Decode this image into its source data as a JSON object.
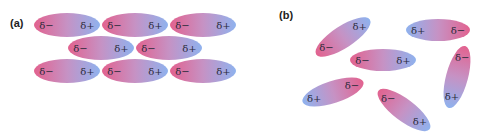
{
  "colors": {
    "negative": "#e2628f",
    "positive": "#8fb2ee",
    "background": "#ffffff",
    "text": "#2a2a3a"
  },
  "panel_a": {
    "label": "(a)",
    "description": "ordered dipoles aligned head-to-tail",
    "molecules": [
      {
        "cx": 67,
        "cy": 25,
        "rx": 33,
        "ry": 12,
        "angle": 0,
        "neg": "δ−",
        "pos": "δ+"
      },
      {
        "cx": 135,
        "cy": 25,
        "rx": 33,
        "ry": 12,
        "angle": 0,
        "neg": "δ−",
        "pos": "δ+"
      },
      {
        "cx": 203,
        "cy": 25,
        "rx": 33,
        "ry": 12,
        "angle": 0,
        "neg": "δ−",
        "pos": "δ+"
      },
      {
        "cx": 101,
        "cy": 48,
        "rx": 33,
        "ry": 12,
        "angle": 0,
        "neg": "δ−",
        "pos": "δ+"
      },
      {
        "cx": 169,
        "cy": 48,
        "rx": 33,
        "ry": 12,
        "angle": 0,
        "neg": "δ−",
        "pos": "δ+"
      },
      {
        "cx": 67,
        "cy": 71,
        "rx": 33,
        "ry": 12,
        "angle": 0,
        "neg": "δ−",
        "pos": "δ+"
      },
      {
        "cx": 135,
        "cy": 71,
        "rx": 33,
        "ry": 12,
        "angle": 0,
        "neg": "δ−",
        "pos": "δ+"
      },
      {
        "cx": 203,
        "cy": 71,
        "rx": 33,
        "ry": 12,
        "angle": 0,
        "neg": "δ−",
        "pos": "δ+"
      }
    ]
  },
  "panel_b": {
    "label": "(b)",
    "description": "randomly oriented dipoles",
    "molecules": [
      {
        "cx": 343,
        "cy": 37,
        "rx": 32,
        "ry": 11,
        "angle": -33,
        "neg": "δ−",
        "pos": "δ+"
      },
      {
        "cx": 438,
        "cy": 30,
        "rx": 32,
        "ry": 11,
        "angle": 180,
        "neg": "δ−",
        "pos": "δ+"
      },
      {
        "cx": 383,
        "cy": 60,
        "rx": 33,
        "ry": 11,
        "angle": 0,
        "neg": "δ−",
        "pos": "δ+"
      },
      {
        "cx": 457,
        "cy": 77,
        "rx": 32,
        "ry": 11,
        "angle": 105,
        "neg": "δ−",
        "pos": "δ+"
      },
      {
        "cx": 333,
        "cy": 92,
        "rx": 32,
        "ry": 11,
        "angle": 162,
        "neg": "δ−",
        "pos": "δ+"
      },
      {
        "cx": 404,
        "cy": 110,
        "rx": 32,
        "ry": 11,
        "angle": 37,
        "neg": "δ−",
        "pos": "δ+"
      }
    ]
  }
}
